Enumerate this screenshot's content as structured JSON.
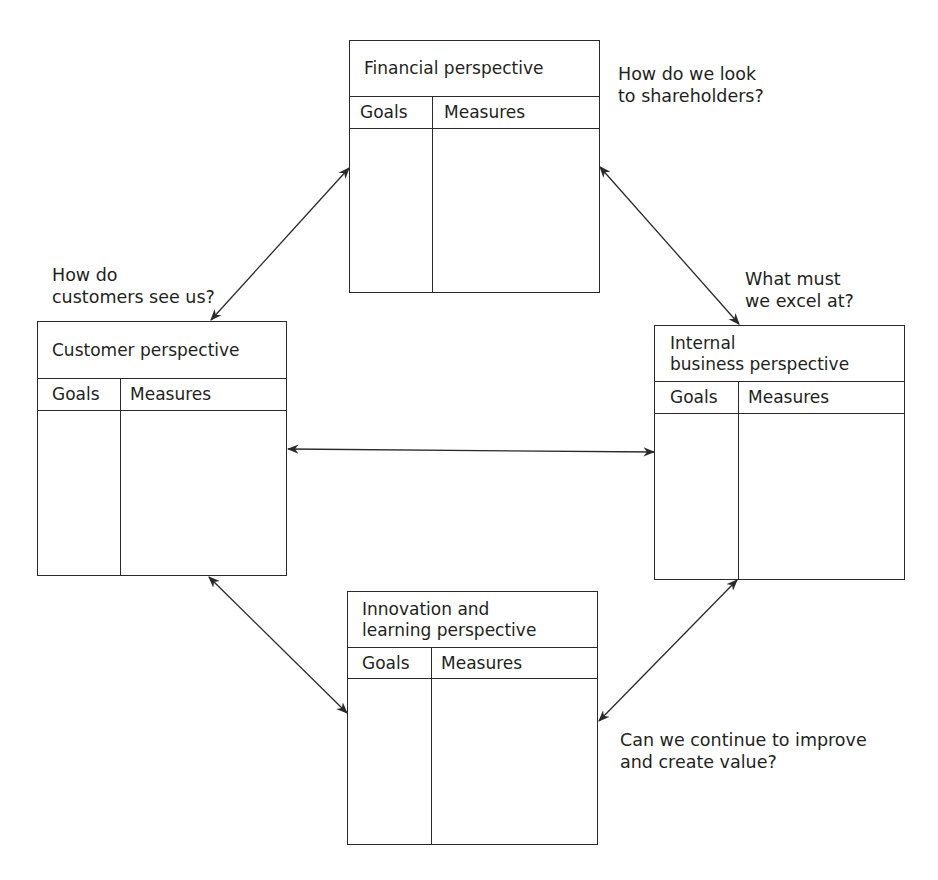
{
  "diagram": {
    "type": "balanced scorecard",
    "perspectives": [
      {
        "id": "financial",
        "title": "Financial perspective",
        "columns": [
          "Goals",
          "Measures"
        ],
        "question": "How do we look\nto shareholders?"
      },
      {
        "id": "customer",
        "title": "Customer perspective",
        "columns": [
          "Goals",
          "Measures"
        ],
        "question": "How do\ncustomers see us?"
      },
      {
        "id": "internal",
        "title": "Internal\nbusiness perspective",
        "columns": [
          "Goals",
          "Measures"
        ],
        "question": "What must\nwe excel at?"
      },
      {
        "id": "innovation",
        "title": "Innovation and\nlearning perspective",
        "columns": [
          "Goals",
          "Measures"
        ],
        "question": "Can we continue to improve\nand create value?"
      }
    ],
    "connections": [
      {
        "from": "financial",
        "to": "customer",
        "bidirectional": true
      },
      {
        "from": "financial",
        "to": "internal",
        "bidirectional": true
      },
      {
        "from": "customer",
        "to": "internal",
        "bidirectional": true
      },
      {
        "from": "customer",
        "to": "innovation",
        "bidirectional": true
      },
      {
        "from": "internal",
        "to": "innovation",
        "bidirectional": true
      }
    ],
    "colors": {
      "line": "#2a2a2a",
      "text": "#231f20",
      "background": "#ffffff"
    }
  }
}
